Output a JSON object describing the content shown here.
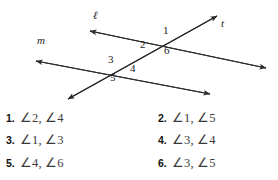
{
  "figure": {
    "name": "two-transversals-angle-diagram",
    "line_labels": [
      {
        "id": "line-label-l",
        "text": "ℓ",
        "x": 93,
        "y": 16
      },
      {
        "id": "line-label-t",
        "text": "t",
        "x": 221,
        "y": 23
      },
      {
        "id": "line-label-m",
        "text": "m",
        "x": 37,
        "y": 40
      }
    ],
    "angle_labels": [
      {
        "id": "angle-label-1",
        "text": "1",
        "x": 163,
        "y": 30
      },
      {
        "id": "angle-label-2",
        "text": "2",
        "x": 140,
        "y": 44
      },
      {
        "id": "angle-label-6",
        "text": "6",
        "x": 164,
        "y": 50
      },
      {
        "id": "angle-label-3",
        "text": "3",
        "x": 108,
        "y": 59
      },
      {
        "id": "angle-label-4",
        "text": "4",
        "x": 130,
        "y": 68
      },
      {
        "id": "angle-label-5",
        "text": "5",
        "x": 110,
        "y": 77
      }
    ],
    "lines": {
      "line_l": {
        "from_x": 90,
        "from_y": 31,
        "to_x": 266,
        "to_y": 68
      },
      "line_m": {
        "from_x": 36,
        "from_y": 61,
        "to_x": 210,
        "to_y": 94
      },
      "line_t": {
        "from_x": 68,
        "from_y": 99,
        "to_x": 217,
        "to_y": 16
      }
    },
    "stroke_color": "#2b2b2b"
  },
  "answers": {
    "rows": [
      {
        "left": {
          "number": "1.",
          "text": "∠2, ∠4"
        },
        "right": {
          "number": "2.",
          "text": "∠1, ∠5"
        }
      },
      {
        "left": {
          "number": "3.",
          "text": "∠1, ∠3"
        },
        "right": {
          "number": "4.",
          "text": "∠3, ∠4"
        }
      },
      {
        "left": {
          "number": "5.",
          "text": "∠4, ∠6"
        },
        "right": {
          "number": "6.",
          "text": "∠3, ∠5"
        }
      }
    ]
  }
}
